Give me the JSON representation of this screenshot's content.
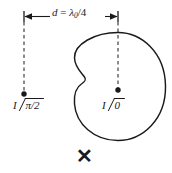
{
  "figure": {
    "background_color": "#ffffff",
    "stroke_color": "#1a1a1a"
  },
  "dimension": {
    "variable": "d",
    "equals": " = ",
    "lambda": "λ",
    "subscript": "0",
    "divisor": "/4",
    "full_text": "d = λ0/4"
  },
  "sources": {
    "left": {
      "current_symbol": "I",
      "angle_symbol": "∠",
      "phase": "π/2",
      "full_text": "I ∠π/2"
    },
    "right": {
      "current_symbol": "I",
      "angle_symbol": "∠",
      "phase": "0",
      "full_text": "I ∠0"
    }
  },
  "marks": {
    "cross": "✕"
  },
  "icons": {
    "arrow_left": "arrow-left-icon",
    "arrow_right": "arrow-right-icon",
    "cross": "cross-icon"
  }
}
